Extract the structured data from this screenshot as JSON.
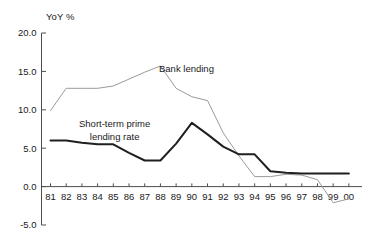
{
  "chart_data": {
    "type": "line",
    "title": "",
    "xlabel": "",
    "ylabel": "YoY %",
    "ylim": [
      -5.0,
      20.0
    ],
    "yticks": [
      20.0,
      15.0,
      10.0,
      5.0,
      0.0,
      -5.0
    ],
    "ytick_labels": [
      "20.0",
      "15.0",
      "10.0",
      "5.0",
      "0.0",
      "-5.0"
    ],
    "grid": false,
    "legend_position": "inline-annotation",
    "categories": [
      "81",
      "82",
      "83",
      "84",
      "85",
      "86",
      "87",
      "88",
      "89",
      "90",
      "91",
      "92",
      "93",
      "94",
      "95",
      "96",
      "97",
      "98",
      "99",
      "00"
    ],
    "x": [
      81,
      82,
      83,
      84,
      85,
      86,
      87,
      88,
      89,
      90,
      91,
      92,
      93,
      94,
      95,
      96,
      97,
      98,
      99,
      0
    ],
    "series": [
      {
        "name": "Bank lending",
        "color": "#9a9a9a",
        "width": 1,
        "values": [
          9.9,
          12.8,
          12.8,
          12.8,
          13.1,
          14.0,
          14.9,
          15.7,
          12.8,
          11.7,
          11.2,
          7.0,
          4.0,
          1.3,
          1.3,
          1.6,
          1.5,
          0.9,
          -2.1,
          -1.6
        ]
      },
      {
        "name": "Short-term prime lending rate",
        "color": "#1f1f1f",
        "width": 2,
        "values": [
          6.0,
          6.0,
          5.7,
          5.5,
          5.5,
          4.4,
          3.4,
          3.4,
          5.6,
          8.3,
          6.8,
          5.2,
          4.2,
          4.2,
          2.0,
          1.8,
          1.7,
          1.7,
          1.7,
          1.7
        ]
      }
    ],
    "annotations": [
      {
        "id": "bank-lending",
        "text": "Bank lending",
        "lines": [
          "Bank lending"
        ]
      },
      {
        "id": "prime-rate",
        "text": "Short-term prime lending rate",
        "lines": [
          "Short-term prime",
          "lending rate"
        ]
      }
    ]
  },
  "axes": {
    "y_unit_label": "YoY %"
  }
}
